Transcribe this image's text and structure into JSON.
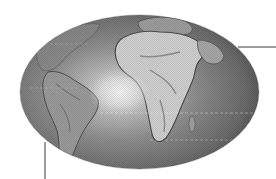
{
  "figure": {
    "projection": "elliptical",
    "colors": {
      "background": "#ffffff",
      "ocean_center": "#e6e6e6",
      "ocean_mid": "#8c8c8c",
      "ocean_edge": "#4e4e4e",
      "land_light": "#c8c8c8",
      "land_dark": "#5a5a5a",
      "leader_line": "#3a3a3a"
    },
    "regions": [
      {
        "name": "Africa"
      },
      {
        "name": "South America"
      },
      {
        "name": "North America (partial)"
      },
      {
        "name": "Europe (partial)"
      },
      {
        "name": "Atlantic Ocean"
      }
    ],
    "leader_lines": [
      {
        "id": "right-callout",
        "orientation": "horizontal"
      },
      {
        "id": "bottom-callout",
        "orientation": "vertical"
      }
    ]
  }
}
